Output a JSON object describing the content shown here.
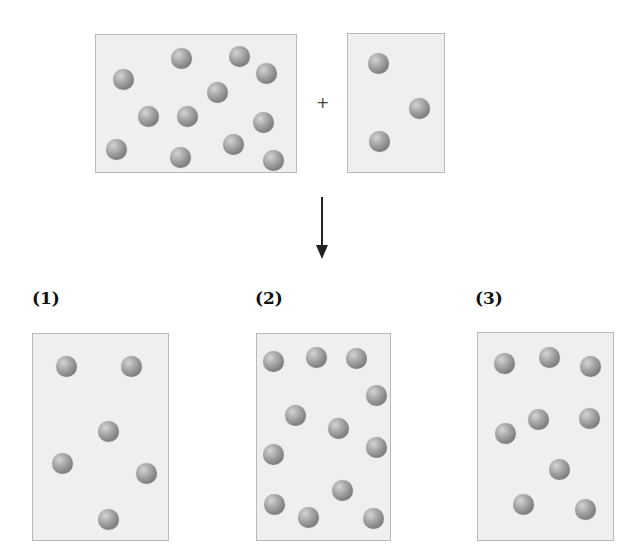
{
  "reactants": {
    "operator": "+",
    "boxes": [
      {
        "name": "reactant-a",
        "x": 95,
        "y": 34,
        "w": 202,
        "h": 139,
        "particle_count": 12,
        "particles": [
          [
            123,
            79
          ],
          [
            181,
            58
          ],
          [
            239,
            56
          ],
          [
            266,
            73
          ],
          [
            217,
            92
          ],
          [
            148,
            116
          ],
          [
            187,
            116
          ],
          [
            263,
            122
          ],
          [
            116,
            149
          ],
          [
            180,
            157
          ],
          [
            233,
            144
          ],
          [
            273,
            160
          ]
        ]
      },
      {
        "name": "reactant-b",
        "x": 347,
        "y": 33,
        "w": 98,
        "h": 140,
        "particle_count": 3,
        "particles": [
          [
            378,
            63
          ],
          [
            419,
            108
          ],
          [
            379,
            141
          ]
        ]
      }
    ]
  },
  "arrow": {
    "direction": "down"
  },
  "options": [
    {
      "label": "(1)",
      "label_x": 32,
      "label_y": 288,
      "x": 32,
      "y": 333,
      "w": 137,
      "h": 208,
      "particle_count": 6,
      "particles": [
        [
          66,
          366
        ],
        [
          131,
          366
        ],
        [
          108,
          431
        ],
        [
          62,
          463
        ],
        [
          146,
          473
        ],
        [
          108,
          519
        ]
      ]
    },
    {
      "label": "(2)",
      "label_x": 255,
      "label_y": 288,
      "x": 256,
      "y": 333,
      "w": 135,
      "h": 208,
      "particle_count": 12,
      "particles": [
        [
          273,
          361
        ],
        [
          316,
          357
        ],
        [
          356,
          358
        ],
        [
          376,
          395
        ],
        [
          295,
          415
        ],
        [
          338,
          428
        ],
        [
          376,
          447
        ],
        [
          273,
          454
        ],
        [
          342,
          490
        ],
        [
          274,
          504
        ],
        [
          308,
          517
        ],
        [
          373,
          518
        ]
      ]
    },
    {
      "label": "(3)",
      "label_x": 475,
      "label_y": 288,
      "x": 477,
      "y": 332,
      "w": 137,
      "h": 209,
      "particle_count": 9,
      "particles": [
        [
          504,
          363
        ],
        [
          549,
          357
        ],
        [
          590,
          366
        ],
        [
          538,
          419
        ],
        [
          589,
          418
        ],
        [
          505,
          433
        ],
        [
          559,
          469
        ],
        [
          523,
          504
        ],
        [
          585,
          509
        ]
      ]
    }
  ],
  "colors": {
    "box_fill": "#efefef",
    "box_border": "#b9b9b9",
    "particle": "#8a8a8a"
  }
}
